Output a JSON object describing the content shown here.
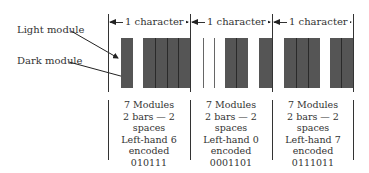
{
  "callouts": {
    "light_module": "Light module",
    "dark_module": "Dark module"
  },
  "dimension_label": "1 character",
  "characters": [
    {
      "label": "1 character",
      "pattern": "0101111",
      "description": {
        "modules": "7 Modules",
        "bars_spaces": "2 bars — 2 spaces",
        "set": "Left-hand 6",
        "encoded": "encoded",
        "code": "010111"
      }
    },
    {
      "label": "1 character",
      "pattern": "0001101",
      "description": {
        "modules": "7 Modules",
        "bars_spaces": "2 bars — 2 spaces",
        "set": "Left-hand 0",
        "encoded": "encoded",
        "code": "0001101"
      }
    },
    {
      "label": "1 character",
      "pattern": "0111011",
      "description": {
        "modules": "7 Modules",
        "bars_spaces": "2 bars — 2 spaces",
        "set": "Left-hand 7",
        "encoded": "encoded",
        "code": "0111011"
      }
    }
  ],
  "colors": {
    "dark_module": "#555555",
    "line": "#333333",
    "background": "#ffffff"
  }
}
